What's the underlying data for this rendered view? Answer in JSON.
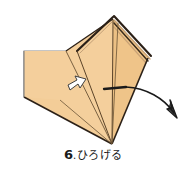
{
  "figure": {
    "name": "origami-step-diagram",
    "colors": {
      "paper_front": "#f2c993",
      "paper_front_light": "#f7d9ad",
      "paper_front_shade": "#e8b878",
      "paper_back": "#ffffff",
      "outline": "#231a12",
      "fold_line": "#6b5436",
      "thin_line": "#8c8c8c",
      "arrow": "#1a1a1a",
      "pointer_fill": "#ffffff",
      "pointer_stroke": "#3a3a3a",
      "background": "#ffffff"
    },
    "parts": [
      {
        "name": "white-flap-panel",
        "label": "unfolded white square flap (back of paper)"
      },
      {
        "name": "tan-upper-left-panel",
        "label": "upper left tan panel"
      },
      {
        "name": "tan-lower-panel",
        "label": "lower tan triangle"
      },
      {
        "name": "tan-right-panel",
        "label": "right tan panel"
      },
      {
        "name": "layered-edge-stack",
        "label": "stacked folded edges along the top ridge"
      },
      {
        "name": "pointer-arrow",
        "label": "white hollow arrow indicating the flap to lift"
      },
      {
        "name": "motion-arrow",
        "label": "curved arrow showing the flap swinging open to the right"
      }
    ]
  },
  "caption": {
    "step_number": "6",
    "separator": ".",
    "text": "ひろげる"
  }
}
